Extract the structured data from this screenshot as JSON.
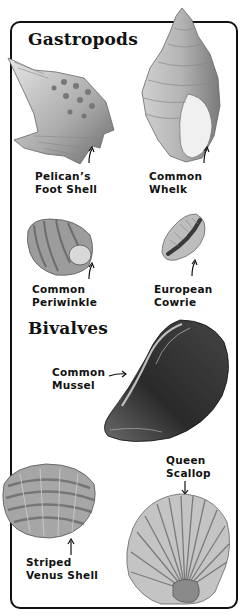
{
  "sections": [
    {
      "heading": "Gastropods",
      "shells": [
        {
          "name_line1": "Pelican’s",
          "name_line2": "Foot Shell"
        },
        {
          "name_line1": "Common",
          "name_line2": "Whelk"
        },
        {
          "name_line1": "Common",
          "name_line2": "Periwinkle"
        },
        {
          "name_line1": "European",
          "name_line2": "Cowrie"
        }
      ]
    },
    {
      "heading": "Bivalves",
      "shells": [
        {
          "name_line1": "Common",
          "name_line2": "Mussel"
        },
        {
          "name_line1": "Queen",
          "name_line2": "Scallop"
        },
        {
          "name_line1": "Striped",
          "name_line2": "Venus Shell"
        }
      ]
    }
  ],
  "colors": {
    "ink": "#111111",
    "shell_light": "#d9d9d9",
    "shell_mid": "#9a9a9a",
    "shell_dark": "#3a3a3a",
    "mussel": "#2a2a2a"
  }
}
